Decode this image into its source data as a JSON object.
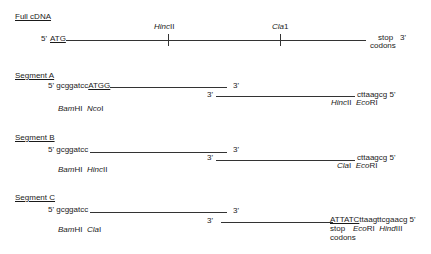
{
  "full_cdna": {
    "header": "Full cDNA",
    "five_prime": "5'",
    "start": "ATG",
    "sites": [
      {
        "italic": "Hinc",
        "roman": "II"
      },
      {
        "italic": "Cla",
        "roman": "1"
      }
    ],
    "stop_line1": "stop",
    "stop_line2": "codons",
    "three_prime": "3'"
  },
  "segments": [
    {
      "header": "Segment A",
      "top_prefix": "5' gcggatcc",
      "top_underlined": "ATGG",
      "top_end": "3'",
      "bottom_start": "3'",
      "bottom_seq": "cttaagcg 5'",
      "left_sites": [
        {
          "italic": "Bam",
          "roman": "HI"
        },
        {
          "italic": "Nco",
          "roman": "I"
        }
      ],
      "right_sites": [
        {
          "italic": "Hinc",
          "roman": "II"
        },
        {
          "italic": "Eco",
          "roman": "RI"
        }
      ]
    },
    {
      "header": "Segment B",
      "top_prefix": "5' gcggatcc",
      "top_end": "3'",
      "bottom_start": "3'",
      "bottom_seq": "cttaagcg 5'",
      "left_sites": [
        {
          "italic": "Bam",
          "roman": "HI"
        },
        {
          "italic": "Hinc",
          "roman": "II"
        }
      ],
      "right_sites": [
        {
          "italic": "Cla",
          "roman": "I"
        },
        {
          "italic": "Eco",
          "roman": "RI"
        }
      ]
    },
    {
      "header": "Segment C",
      "top_prefix": "5' gcggatcc",
      "top_end": "3'",
      "bottom_start": "3'",
      "bottom_underlined": "ATTATC",
      "bottom_seq": "ttaagttcgaacg 5'",
      "left_sites": [
        {
          "italic": "Bam",
          "roman": "HI"
        },
        {
          "italic": "Cla",
          "roman": "I"
        }
      ],
      "right_stop_line1": "stop",
      "right_stop_line2": "codons",
      "right_sites": [
        {
          "italic": "Eco",
          "roman": "RI"
        },
        {
          "italic": "Hind",
          "roman": "III"
        }
      ]
    }
  ]
}
